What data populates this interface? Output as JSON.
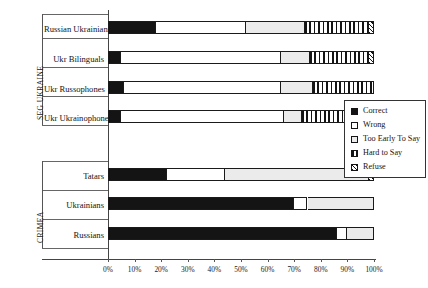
{
  "chart_data": {
    "type": "bar",
    "orientation": "horizontal",
    "stacked": true,
    "title": "",
    "xlabel": "",
    "ylabel": "",
    "xlim": [
      0,
      100
    ],
    "xticks": [
      "0%",
      "10%",
      "20%",
      "30%",
      "40%",
      "50%",
      "60%",
      "70%",
      "80%",
      "90%",
      "100%"
    ],
    "grid": false,
    "legend_position": "right-middle",
    "groups": [
      {
        "name": "SEG UKRAINE",
        "categories": [
          "Russian Ukrainians",
          "Ukr Bilinguals",
          "Ukr Russophones",
          "Ukr Ukrainophones"
        ]
      },
      {
        "name": "CRIMEA",
        "categories": [
          "Tatars",
          "Ukrainians",
          "Russians"
        ]
      }
    ],
    "categories": [
      "Russian Ukrainians",
      "Ukr Bilinguals",
      "Ukr Russophones",
      "Ukr Ukrainophones",
      "Tatars",
      "Ukrainians",
      "Russians"
    ],
    "series": [
      {
        "name": "Correct",
        "fill": "fill-correct",
        "values": [
          18,
          5,
          6,
          5,
          22,
          70,
          86
        ]
      },
      {
        "name": "Wrong",
        "fill": "fill-wrong",
        "values": [
          34,
          60,
          59,
          61,
          22,
          5,
          4
        ]
      },
      {
        "name": "Too Early To Say",
        "fill": "fill-early",
        "values": [
          22,
          11,
          12,
          7,
          54,
          25,
          10
        ]
      },
      {
        "name": "Hard to Say",
        "fill": "fill-hard",
        "values": [
          24,
          22,
          23,
          25,
          0,
          0,
          0
        ]
      },
      {
        "name": "Refuse",
        "fill": "fill-refuse",
        "values": [
          2,
          2,
          0,
          2,
          2,
          0,
          0
        ]
      }
    ]
  },
  "legend": {
    "items": [
      {
        "label": "Correct",
        "swatch": "fill-correct"
      },
      {
        "label": "Wrong",
        "swatch": "fill-wrong"
      },
      {
        "label": "Too Early To Say",
        "swatch": "fill-early"
      },
      {
        "label": "Hard to Say",
        "swatch": "fill-hard"
      },
      {
        "label": "Refuse",
        "swatch": "fill-refuse"
      }
    ]
  }
}
